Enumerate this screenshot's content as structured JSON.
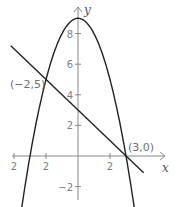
{
  "chart_data": {
    "type": "line",
    "title": "",
    "xlabel": "x",
    "ylabel": "y",
    "xlim": [
      -4.6,
      5.2
    ],
    "ylim": [
      -3.0,
      9.6
    ],
    "grid": false,
    "x_ticks": [
      {
        "value": -4,
        "label": "2"
      },
      {
        "value": -2,
        "label": "2"
      },
      {
        "value": 2,
        "label": "2"
      }
    ],
    "y_ticks": [
      {
        "value": 8,
        "label": "8"
      },
      {
        "value": 6,
        "label": "6"
      },
      {
        "value": 4,
        "label": "4"
      },
      {
        "value": 2,
        "label": "2"
      },
      {
        "value": -2,
        "label": "−2"
      }
    ],
    "series": [
      {
        "name": "parabola",
        "equation": "y = 9 - x^2",
        "x_range": [
          -3.6,
          3.6
        ],
        "color": "#222222"
      },
      {
        "name": "line",
        "equation": "y = 3 - x",
        "x_range": [
          -4.2,
          4.1
        ],
        "color": "#222222"
      }
    ],
    "annotations": [
      {
        "text": "(−2,5)",
        "x": -2,
        "y": 5
      },
      {
        "text": "(3,0)",
        "x": 3,
        "y": 0
      }
    ]
  }
}
